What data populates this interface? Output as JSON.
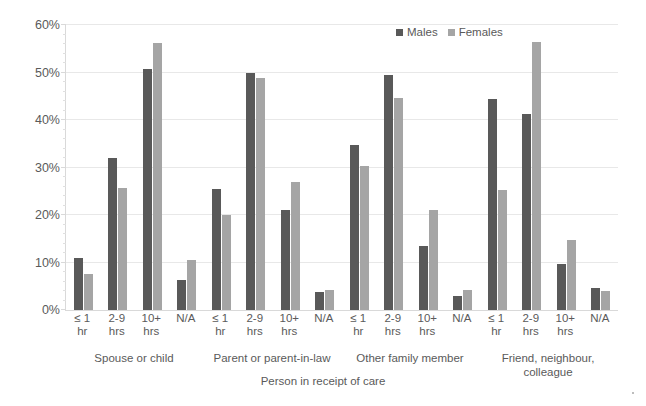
{
  "chart_data": {
    "type": "bar",
    "title": "",
    "xlabel": "Person in receipt of care",
    "ylabel": "",
    "ylim": [
      0,
      60
    ],
    "ytick_labels": [
      "0%",
      "10%",
      "20%",
      "30%",
      "40%",
      "50%",
      "60%"
    ],
    "ytick_values": [
      0,
      10,
      20,
      30,
      40,
      50,
      60
    ],
    "minor_tick_step": 2,
    "grid": "horizontal",
    "legend_position": "top-right",
    "legend": [
      "Males",
      "Females"
    ],
    "categories": [
      "≤ 1 hr",
      "2-9 hrs",
      "10+ hrs",
      "N/A"
    ],
    "category_lines": [
      [
        "≤ 1",
        "hr"
      ],
      [
        "2-9",
        "hrs"
      ],
      [
        "10+",
        "hrs"
      ],
      [
        "N/A",
        ""
      ]
    ],
    "groups": [
      {
        "name": "Spouse or child",
        "name_lines": [
          "Spouse or child"
        ],
        "series": [
          {
            "name": "Males",
            "values": [
              10.9,
              31.9,
              50.7,
              6.4
            ]
          },
          {
            "name": "Females",
            "values": [
              7.5,
              25.7,
              56.2,
              10.6
            ]
          }
        ]
      },
      {
        "name": "Parent or parent-in-law",
        "name_lines": [
          "Parent or parent-in-law"
        ],
        "series": [
          {
            "name": "Males",
            "values": [
              25.5,
              49.8,
              21.0,
              3.7
            ]
          },
          {
            "name": "Females",
            "values": [
              19.9,
              48.9,
              27.0,
              4.3
            ]
          }
        ]
      },
      {
        "name": "Other family member",
        "name_lines": [
          "Other family member"
        ],
        "series": [
          {
            "name": "Males",
            "values": [
              34.8,
              49.5,
              13.5,
              2.9
            ]
          },
          {
            "name": "Females",
            "values": [
              30.3,
              44.6,
              21.0,
              4.3
            ]
          }
        ]
      },
      {
        "name": "Friend, neighbour, colleague",
        "name_lines": [
          "Friend, neighbour,",
          "colleague"
        ],
        "series": [
          {
            "name": "Males",
            "values": [
              44.4,
              41.2,
              9.6,
              4.6
            ]
          },
          {
            "name": "Females",
            "values": [
              25.2,
              56.4,
              14.8,
              4.1
            ]
          }
        ]
      }
    ],
    "colors": {
      "males": "#595959",
      "females": "#a5a5a5",
      "gridline": "#e8e8e8",
      "axis": "#d9d9d9",
      "text": "#5a5a5a",
      "background": "#ffffff"
    }
  }
}
